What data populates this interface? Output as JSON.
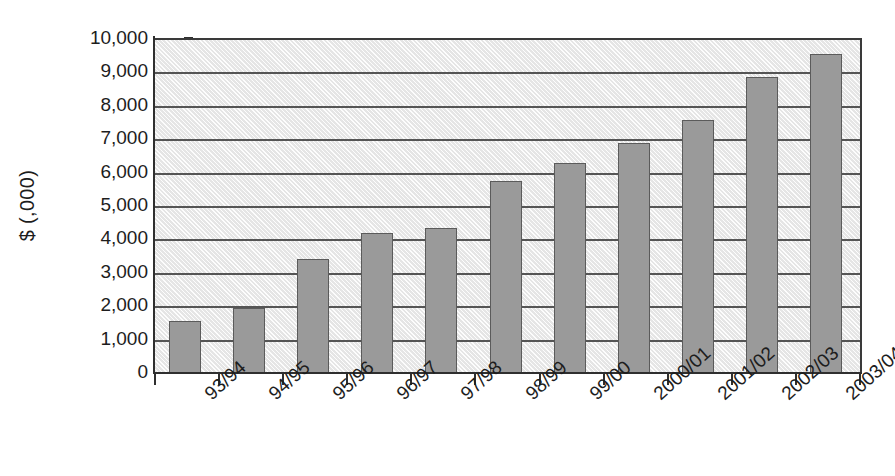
{
  "chart_data": {
    "type": "bar",
    "title": "",
    "subtitle": "",
    "xlabel": "",
    "ylabel": "$ (,000)",
    "categories": [
      "93/94",
      "94/95",
      "95/96",
      "96/97",
      "97/98",
      "98/99",
      "99/00",
      "2000/01",
      "2001/02",
      "2002/03",
      "2003/04"
    ],
    "values": [
      1600,
      1980,
      3440,
      4220,
      4370,
      5790,
      6310,
      6930,
      7610,
      8880,
      9570
    ],
    "series": [
      {
        "name": "",
        "values": [
          1600,
          1980,
          3440,
          4220,
          4370,
          5790,
          6310,
          6930,
          7610,
          8880,
          9570
        ]
      }
    ],
    "ylim": [
      0,
      10000
    ],
    "ytick_step": 1000,
    "ytick_labels": [
      "0",
      "1,000",
      "2,000",
      "3,000",
      "4,000",
      "5,000",
      "6,000",
      "7,000",
      "8,000",
      "9,000",
      "10,000"
    ],
    "ytick_values": [
      0,
      1000,
      2000,
      3000,
      4000,
      5000,
      6000,
      7000,
      8000,
      9000,
      10000
    ],
    "grid": "horizontal",
    "legend": "none",
    "annotations": [],
    "bar_color": "#9a9a9a",
    "bar_border_color": "#5b5b5b",
    "plot_background_color": "#efefef",
    "axis_color": "#2f2f2f",
    "gridline_color": "#555555",
    "xtick_label_rotation": -42
  }
}
